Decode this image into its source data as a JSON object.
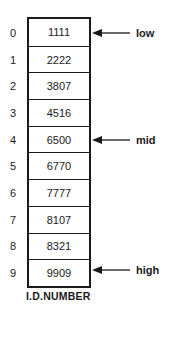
{
  "diagram": {
    "type": "sorted-array-binary-search",
    "caption": "I.D.NUMBER",
    "cells": [
      {
        "index": "0",
        "value": "1111"
      },
      {
        "index": "1",
        "value": "2222"
      },
      {
        "index": "2",
        "value": "3807"
      },
      {
        "index": "3",
        "value": "4516"
      },
      {
        "index": "4",
        "value": "6500"
      },
      {
        "index": "5",
        "value": "6770"
      },
      {
        "index": "6",
        "value": "7777"
      },
      {
        "index": "7",
        "value": "8107"
      },
      {
        "index": "8",
        "value": "8321"
      },
      {
        "index": "9",
        "value": "9909"
      }
    ],
    "pointers": [
      {
        "label": "low",
        "index": 0
      },
      {
        "label": "mid",
        "index": 4
      },
      {
        "label": "high",
        "index": 9
      }
    ],
    "colors": {
      "ink": "#1a1a1a",
      "background": "#ffffff"
    }
  }
}
